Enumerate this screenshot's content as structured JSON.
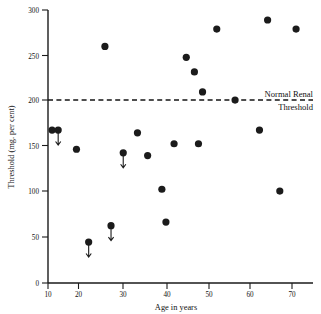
{
  "chart_data": {
    "type": "scatter",
    "title": "",
    "xlabel": "Age in years",
    "ylabel": "Threshold (mg. per cent)",
    "xlim": [
      10,
      75
    ],
    "ylim": [
      0,
      300
    ],
    "xticks": [
      10,
      20,
      30,
      40,
      50,
      60,
      70
    ],
    "xtick_labels": [
      "10",
      "20",
      "30",
      "40",
      "50",
      "60",
      "70"
    ],
    "yticks": [
      0,
      50,
      100,
      150,
      200,
      250,
      300
    ],
    "ytick_labels": [
      "0",
      "50",
      "100",
      "150",
      "200",
      "250",
      "300"
    ],
    "grid": false,
    "legend": null,
    "points": [
      {
        "x": 11,
        "y": 168,
        "arrow": false
      },
      {
        "x": 12.5,
        "y": 168,
        "arrow": true
      },
      {
        "x": 17,
        "y": 147,
        "arrow": false
      },
      {
        "x": 20,
        "y": 45,
        "arrow": true
      },
      {
        "x": 24,
        "y": 260,
        "arrow": false
      },
      {
        "x": 25.5,
        "y": 63,
        "arrow": true
      },
      {
        "x": 28.5,
        "y": 143,
        "arrow": true
      },
      {
        "x": 32,
        "y": 165,
        "arrow": false
      },
      {
        "x": 34.5,
        "y": 140,
        "arrow": false
      },
      {
        "x": 41,
        "y": 153,
        "arrow": false
      },
      {
        "x": 38,
        "y": 103,
        "arrow": false
      },
      {
        "x": 39,
        "y": 67,
        "arrow": false
      },
      {
        "x": 44,
        "y": 248,
        "arrow": false
      },
      {
        "x": 46,
        "y": 232,
        "arrow": false
      },
      {
        "x": 48,
        "y": 210,
        "arrow": false
      },
      {
        "x": 47,
        "y": 153,
        "arrow": false
      },
      {
        "x": 51.5,
        "y": 279,
        "arrow": false
      },
      {
        "x": 56,
        "y": 201,
        "arrow": false
      },
      {
        "x": 64,
        "y": 289,
        "arrow": false
      },
      {
        "x": 62,
        "y": 168,
        "arrow": false
      },
      {
        "x": 67,
        "y": 101,
        "arrow": false
      },
      {
        "x": 71,
        "y": 279,
        "arrow": false
      }
    ],
    "annotations": [
      {
        "name": "normal-renal-threshold",
        "line_value": 200,
        "line_style": "dashed",
        "label_line1": "Normal Renal",
        "label_line2": "Threshold"
      }
    ]
  }
}
